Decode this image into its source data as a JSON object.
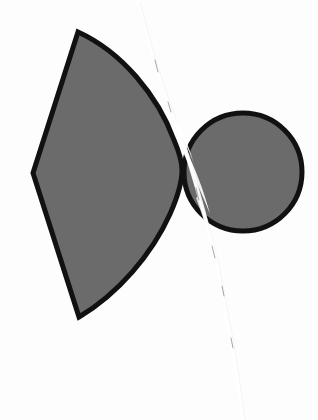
{
  "page": {
    "background_color": "#fdfdfd",
    "width": 318,
    "height": 420,
    "media": "scanned-worksheet"
  },
  "problem": {
    "number_label": "14.",
    "label_color": "#141414"
  },
  "figure": {
    "stroke_color": "#111111",
    "fill_color": "#6b6b6b",
    "stroke_width": 5,
    "shapes": [
      {
        "name": "sector-fan",
        "kind": "circular-sector",
        "fill": "#6b6b6b",
        "stroke": "#111111",
        "vertices": {
          "top": [
            78,
            32
          ],
          "left": [
            33,
            173
          ],
          "bottom": [
            79,
            317
          ]
        },
        "arc_extreme_right": [
          182,
          168
        ],
        "bounding_box": [
          33,
          32,
          149,
          285
        ]
      },
      {
        "name": "circle",
        "kind": "circle",
        "fill": "#6b6b6b",
        "stroke": "#111111",
        "center": [
          243,
          172
        ],
        "radius": 59,
        "bounding_box": [
          184,
          113,
          118,
          118
        ]
      }
    ],
    "artifacts": [
      {
        "name": "scan-crack",
        "kind": "white-scratch-line",
        "color": "#ffffff",
        "description": "Pale torn/cracked paper line running top-center to bottom-right",
        "path_points": [
          [
            139,
            0
          ],
          [
            146,
            24
          ],
          [
            152,
            52
          ],
          [
            160,
            78
          ],
          [
            168,
            100
          ],
          [
            176,
            122
          ],
          [
            184,
            146
          ],
          [
            190,
            166
          ],
          [
            196,
            186
          ],
          [
            203,
            208
          ],
          [
            210,
            232
          ],
          [
            216,
            258
          ],
          [
            221,
            284
          ],
          [
            226,
            310
          ],
          [
            231,
            336
          ],
          [
            235,
            362
          ],
          [
            239,
            388
          ],
          [
            242,
            412
          ]
        ]
      }
    ]
  }
}
